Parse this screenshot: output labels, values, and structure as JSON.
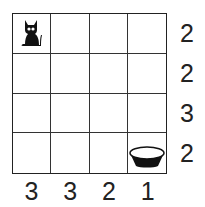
{
  "puzzle": {
    "rows": 4,
    "cols": 4,
    "row_clues": [
      "2",
      "2",
      "3",
      "2"
    ],
    "col_clues": [
      "3",
      "3",
      "2",
      "1"
    ],
    "start": {
      "row": 0,
      "col": 0,
      "icon": "cat-icon"
    },
    "goal": {
      "row": 3,
      "col": 3,
      "icon": "bowl-icon"
    },
    "colors": {
      "ink": "#222222",
      "background": "#ffffff"
    }
  }
}
